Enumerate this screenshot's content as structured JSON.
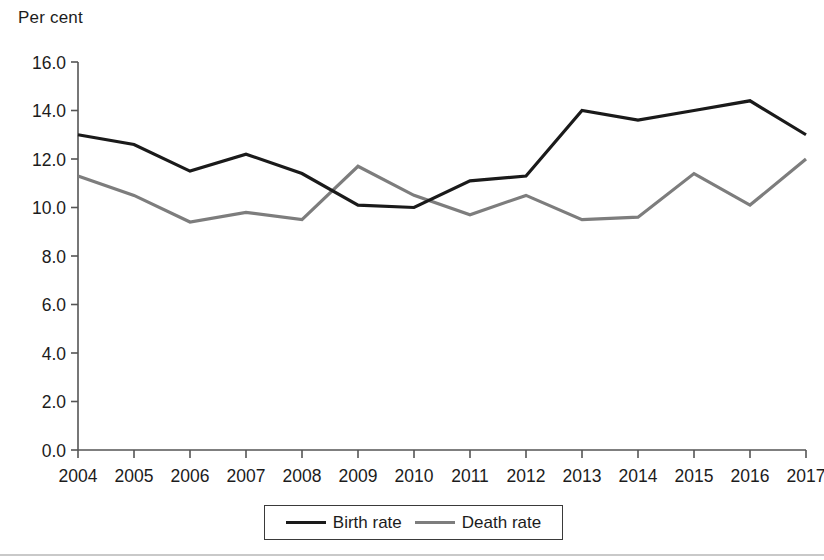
{
  "chart_data": {
    "type": "line",
    "title": "",
    "ylabel": "Per cent",
    "xlabel": "",
    "ylim": [
      0.0,
      16.0
    ],
    "ytick_labels": [
      "0.0",
      "2.0",
      "4.0",
      "6.0",
      "8.0",
      "10.0",
      "12.0",
      "14.0",
      "16.0"
    ],
    "ytick_values": [
      0.0,
      2.0,
      4.0,
      6.0,
      8.0,
      10.0,
      12.0,
      14.0,
      16.0
    ],
    "categories": [
      "2004",
      "2005",
      "2006",
      "2007",
      "2008",
      "2009",
      "2010",
      "2011",
      "2012",
      "2013",
      "2014",
      "2015",
      "2016",
      "2017"
    ],
    "x": [
      2004,
      2005,
      2006,
      2007,
      2008,
      2009,
      2010,
      2011,
      2012,
      2013,
      2014,
      2015,
      2016,
      2017
    ],
    "grid": false,
    "legend_position": "bottom",
    "series": [
      {
        "name": "Birth rate",
        "color": "#1a1a1a",
        "width": 3.2,
        "values": [
          13.0,
          12.6,
          11.5,
          12.2,
          11.4,
          10.1,
          10.0,
          11.1,
          11.3,
          14.0,
          13.6,
          14.0,
          14.4,
          13.0
        ]
      },
      {
        "name": "Death rate",
        "color": "#7d7d7d",
        "width": 3.2,
        "values": [
          11.3,
          10.5,
          9.4,
          9.8,
          9.5,
          11.7,
          10.5,
          9.7,
          10.5,
          9.5,
          9.6,
          11.4,
          10.1,
          12.0
        ]
      }
    ]
  },
  "legend": {
    "items": [
      {
        "label": "Birth rate",
        "color": "#1a1a1a"
      },
      {
        "label": "Death rate",
        "color": "#7d7d7d"
      }
    ]
  },
  "colors": {
    "birth_rate": "#1a1a1a",
    "death_rate": "#7d7d7d",
    "axis": "#555555",
    "text": "#1c1c1c"
  }
}
